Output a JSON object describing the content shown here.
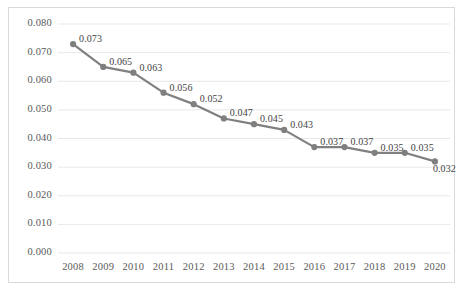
{
  "chart_data": {
    "type": "line",
    "title": "",
    "subtitle": "",
    "xlabel": "",
    "ylabel": "",
    "categories": [
      "2008",
      "2009",
      "2010",
      "2011",
      "2012",
      "2013",
      "2014",
      "2015",
      "2016",
      "2017",
      "2018",
      "2019",
      "2020"
    ],
    "values": [
      0.073,
      0.065,
      0.063,
      0.056,
      0.052,
      0.047,
      0.045,
      0.043,
      0.037,
      0.037,
      0.035,
      0.035,
      0.032
    ],
    "data_labels": [
      "0.073",
      "0.065",
      "0.063",
      "0.056",
      "0.052",
      "0.047",
      "0.045",
      "0.043",
      "0.037",
      "0.037",
      "0.035",
      "0.035",
      "0.032"
    ],
    "ylim": [
      0.0,
      0.08
    ],
    "ytick_labels": [
      "0.080",
      "0.070",
      "0.060",
      "0.050",
      "0.040",
      "0.030",
      "0.020",
      "0.010",
      "0.000"
    ],
    "ytick_values": [
      0.08,
      0.07,
      0.06,
      0.05,
      0.04,
      0.03,
      0.02,
      0.01,
      0.0
    ],
    "grid": true,
    "grid_axis": "y",
    "legend": false,
    "legend_position": "none",
    "series": [
      {
        "name": "series-1",
        "color": "#808080",
        "marker": "circle",
        "values": [
          0.073,
          0.065,
          0.063,
          0.056,
          0.052,
          0.047,
          0.045,
          0.043,
          0.037,
          0.037,
          0.035,
          0.035,
          0.032
        ]
      }
    ],
    "colors": {
      "line": "#808080",
      "marker": "#7f7f7f",
      "grid": "#e8e8e8",
      "border": "#d9d9d9",
      "tick_text": "#595959",
      "label_text": "#3f3f3f",
      "background": "#ffffff"
    }
  }
}
